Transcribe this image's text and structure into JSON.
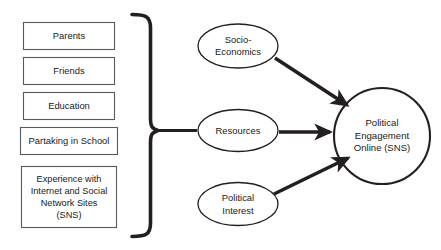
{
  "diagram": {
    "background_color": "#ffffff",
    "stroke_color": "#231f20",
    "box_stroke_color": "#58595b",
    "antecedents": {
      "group_name": "antecedent-factors",
      "brace_icon": "right-curly-brace-icon",
      "items": [
        {
          "label": "Parents"
        },
        {
          "label": "Friends"
        },
        {
          "label": "Education"
        },
        {
          "label": "Partaking in School"
        },
        {
          "label": "Experience with\nInternet and Social\nNetwork Sites\n(SNS)"
        }
      ]
    },
    "mediators": [
      {
        "label": "Socio-\nEconomics"
      },
      {
        "label": "Resources"
      },
      {
        "label": "Political\nInterest"
      }
    ],
    "outcome": {
      "label": "Political\nEngagement\nOnline (SNS)"
    },
    "connectors": [
      {
        "name": "socio-economics-to-outcome",
        "arrowhead": "filled-triangle"
      },
      {
        "name": "resources-to-outcome",
        "arrowhead": "filled-triangle"
      },
      {
        "name": "political-interest-to-outcome",
        "arrowhead": "filled-triangle"
      },
      {
        "name": "brace-to-resources",
        "arrowhead": "none"
      }
    ]
  }
}
